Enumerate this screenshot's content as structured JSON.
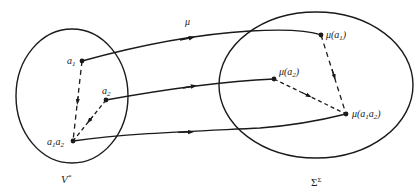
{
  "diagram": {
    "map_label": "μ",
    "domain_set": {
      "label": "V",
      "superscript": "*"
    },
    "codomain_set": {
      "label": "Σ",
      "superscript": "Σ"
    },
    "domain_points": [
      {
        "id": "a1",
        "base": "a",
        "sub": "1"
      },
      {
        "id": "a2",
        "base": "a",
        "sub": "2"
      },
      {
        "id": "a1a2",
        "parts": [
          {
            "base": "a",
            "sub": "1"
          },
          {
            "base": "a",
            "sub": "2"
          }
        ]
      }
    ],
    "codomain_points": [
      {
        "id": "mu_a1",
        "prefix": "μ(",
        "base": "a",
        "sub": "1",
        "suffix": ")"
      },
      {
        "id": "mu_a2",
        "prefix": "μ(",
        "base": "a",
        "sub": "2",
        "suffix": ")"
      },
      {
        "id": "mu_a1a2",
        "prefix": "μ(",
        "parts": [
          {
            "base": "a",
            "sub": "1"
          },
          {
            "base": "a",
            "sub": "2"
          }
        ],
        "suffix": ")"
      }
    ],
    "mappings": [
      {
        "from": "a1",
        "to": "mu_a1",
        "style": "solid"
      },
      {
        "from": "a2",
        "to": "mu_a2",
        "style": "solid"
      },
      {
        "from": "a1a2",
        "to": "mu_a1a2",
        "style": "solid"
      }
    ],
    "compositions": [
      {
        "from": "a1",
        "to": "a1a2",
        "style": "dashed"
      },
      {
        "from": "a2",
        "to": "a1a2",
        "style": "dashed"
      },
      {
        "from": "mu_a1",
        "to": "mu_a1a2",
        "style": "dashed"
      },
      {
        "from": "mu_a2",
        "to": "mu_a1a2",
        "style": "dashed"
      }
    ],
    "colors": {
      "ink": "#1a1a1a",
      "background": "#ffffff"
    }
  }
}
